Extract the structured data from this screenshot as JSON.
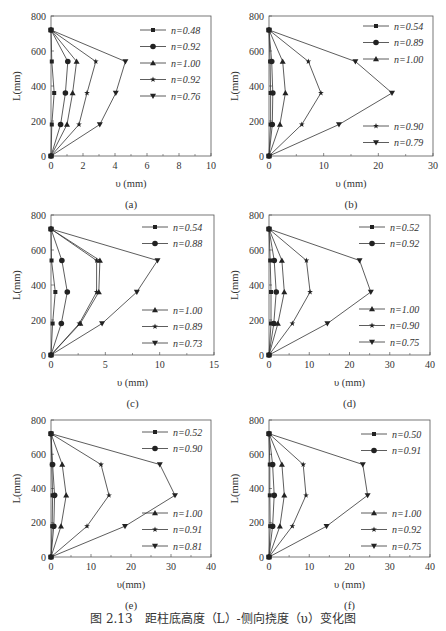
{
  "figure_caption": "图 2.13　距柱底高度（L）-侧向挠度（υ）变化图",
  "chart_data": [
    {
      "id": "a",
      "type": "line",
      "panel_label": "(a)",
      "xlabel": "υ (mm)",
      "ylabel": "L(mm)",
      "xlim": [
        0,
        10
      ],
      "ylim": [
        0,
        800
      ],
      "xticks": [
        0,
        2,
        4,
        6,
        8,
        10
      ],
      "yticks": [
        0,
        200,
        400,
        600,
        800
      ],
      "y": [
        0,
        180,
        360,
        540,
        720
      ],
      "legend_position": "upper-right",
      "series": [
        {
          "name": "n=0.48",
          "marker": "square",
          "values": [
            0,
            0.05,
            0.2,
            0.05,
            0
          ]
        },
        {
          "name": "n=0.92",
          "marker": "circle",
          "values": [
            0,
            0.6,
            0.9,
            1.05,
            0
          ]
        },
        {
          "name": "n=1.00",
          "marker": "triangle-up",
          "values": [
            0,
            1.0,
            1.35,
            1.6,
            0
          ]
        },
        {
          "name": "n=0.92",
          "marker": "star",
          "values": [
            0,
            1.75,
            2.25,
            2.8,
            0
          ]
        },
        {
          "name": "n=0.76",
          "marker": "triangle-down",
          "values": [
            0,
            3.05,
            4.05,
            4.65,
            0
          ]
        }
      ]
    },
    {
      "id": "b",
      "type": "line",
      "panel_label": "(b)",
      "xlabel": "υ (mm)",
      "ylabel": "L(mm)",
      "xlim": [
        0,
        30
      ],
      "ylim": [
        0,
        800
      ],
      "xticks": [
        0,
        10,
        20,
        30
      ],
      "yticks": [
        0,
        200,
        400,
        600,
        800
      ],
      "y": [
        0,
        180,
        360,
        540,
        720
      ],
      "legend_position": "split upper-right / lower-right",
      "series": [
        {
          "name": "n=0.54",
          "marker": "square",
          "values": [
            0,
            0.3,
            0.3,
            0.2,
            0
          ]
        },
        {
          "name": "n=0.89",
          "marker": "circle",
          "values": [
            0,
            0.6,
            0.7,
            0.5,
            0
          ]
        },
        {
          "name": "n=1.00",
          "marker": "triangle-up",
          "values": [
            0,
            2.0,
            3.0,
            2.5,
            0
          ]
        },
        {
          "name": "n=0.90",
          "marker": "star",
          "values": [
            0,
            6.0,
            9.5,
            7.2,
            0
          ]
        },
        {
          "name": "n=0.79",
          "marker": "triangle-down",
          "values": [
            0,
            12.8,
            22.5,
            15.8,
            0
          ]
        }
      ]
    },
    {
      "id": "c",
      "type": "line",
      "panel_label": "(c)",
      "xlabel": "υ (mm)",
      "ylabel": "L(mm)",
      "xlim": [
        0,
        15
      ],
      "ylim": [
        0,
        800
      ],
      "xticks": [
        0,
        5,
        10,
        15
      ],
      "yticks": [
        0,
        200,
        400,
        600,
        800
      ],
      "y": [
        0,
        180,
        360,
        540,
        720
      ],
      "legend_position": "split upper-right / lower-right",
      "series": [
        {
          "name": "n=0.54",
          "marker": "square",
          "values": [
            0,
            0.15,
            0.4,
            0.05,
            0
          ]
        },
        {
          "name": "n=0.88",
          "marker": "circle",
          "values": [
            0,
            0.95,
            1.5,
            1.0,
            0
          ]
        },
        {
          "name": "n=1.00",
          "marker": "triangle-up",
          "values": [
            0,
            2.7,
            4.4,
            4.5,
            0
          ]
        },
        {
          "name": "n=0.89",
          "marker": "star",
          "values": [
            0,
            2.6,
            4.2,
            4.2,
            0
          ]
        },
        {
          "name": "n=0.73",
          "marker": "triangle-down",
          "values": [
            0,
            4.7,
            7.9,
            9.8,
            0
          ]
        }
      ]
    },
    {
      "id": "d",
      "type": "line",
      "panel_label": "(d)",
      "xlabel": "υ (mm)",
      "ylabel": "L(mm)",
      "xlim": [
        0,
        40
      ],
      "ylim": [
        0,
        800
      ],
      "xticks": [
        0,
        10,
        20,
        30,
        40
      ],
      "yticks": [
        0,
        200,
        400,
        600,
        800
      ],
      "y": [
        0,
        180,
        360,
        540,
        720
      ],
      "legend_position": "split upper-right / lower-right",
      "series": [
        {
          "name": "n=0.52",
          "marker": "square",
          "values": [
            0,
            0.5,
            0.5,
            0.3,
            0
          ]
        },
        {
          "name": "n=0.92",
          "marker": "circle",
          "values": [
            0,
            1.2,
            1.8,
            1.3,
            0
          ]
        },
        {
          "name": "n=1.00",
          "marker": "triangle-up",
          "values": [
            0,
            2.2,
            3.8,
            3.2,
            0
          ]
        },
        {
          "name": "n=0.90",
          "marker": "star",
          "values": [
            0,
            5.8,
            10.2,
            9.3,
            0
          ]
        },
        {
          "name": "n=0.75",
          "marker": "triangle-down",
          "values": [
            0,
            14.5,
            25.3,
            22.5,
            0
          ]
        }
      ]
    },
    {
      "id": "e",
      "type": "line",
      "panel_label": "(e)",
      "xlabel": "υ(mm)",
      "ylabel": "L(mm)",
      "xlim": [
        0,
        40
      ],
      "ylim": [
        0,
        800
      ],
      "xticks": [
        0,
        10,
        20,
        30,
        40
      ],
      "yticks": [
        0,
        200,
        400,
        600,
        800
      ],
      "y": [
        0,
        180,
        360,
        540,
        720
      ],
      "legend_position": "split upper-right / lower-right",
      "series": [
        {
          "name": "n=0.52",
          "marker": "square",
          "values": [
            0,
            0.3,
            0.4,
            0.2,
            0
          ]
        },
        {
          "name": "n=0.90",
          "marker": "circle",
          "values": [
            0,
            0.7,
            0.9,
            0.4,
            0
          ]
        },
        {
          "name": "n=1.00",
          "marker": "triangle-up",
          "values": [
            0,
            2.5,
            3.8,
            2.8,
            0
          ]
        },
        {
          "name": "n=0.91",
          "marker": "star",
          "values": [
            0,
            9.0,
            14.5,
            12.5,
            0
          ]
        },
        {
          "name": "n=0.81",
          "marker": "triangle-down",
          "values": [
            0,
            18.5,
            31.0,
            27.2,
            0
          ]
        }
      ]
    },
    {
      "id": "f",
      "type": "line",
      "panel_label": "(f)",
      "xlabel": "υ (mm)",
      "ylabel": "L(mm)",
      "xlim": [
        0,
        40
      ],
      "ylim": [
        0,
        800
      ],
      "xticks": [
        0,
        10,
        20,
        30,
        40
      ],
      "yticks": [
        0,
        200,
        400,
        600,
        800
      ],
      "y": [
        0,
        180,
        360,
        540,
        720
      ],
      "legend_position": "split upper-right / lower-right",
      "series": [
        {
          "name": "n=0.50",
          "marker": "square",
          "values": [
            0,
            0.3,
            0.2,
            0.2,
            0
          ]
        },
        {
          "name": "n=0.91",
          "marker": "circle",
          "values": [
            0,
            0.9,
            1.3,
            0.9,
            0
          ]
        },
        {
          "name": "n=1.00",
          "marker": "triangle-up",
          "values": [
            0,
            2.7,
            3.8,
            3.2,
            0
          ]
        },
        {
          "name": "n=0.92",
          "marker": "star",
          "values": [
            0,
            5.8,
            9.2,
            8.5,
            0
          ]
        },
        {
          "name": "n=0.75",
          "marker": "triangle-down",
          "values": [
            0,
            14.3,
            24.5,
            23.3,
            0
          ]
        }
      ]
    }
  ],
  "layout": {
    "panels": [
      {
        "id": "a",
        "left": 0,
        "top": 0,
        "plot": {
          "x0": 51,
          "x1": 211,
          "y0": 156,
          "y1": 16
        },
        "legend_top_rows": 5,
        "legend_x": 140,
        "legend_y": 30
      },
      {
        "id": "b",
        "left": 223,
        "top": 0,
        "plot": {
          "x0": 46,
          "x1": 210,
          "y0": 156,
          "y1": 16
        },
        "legend_top_rows": 3,
        "legend_x": 140,
        "legend_y": 26,
        "legend_bottom_y": 126
      },
      {
        "id": "c",
        "left": 0,
        "top": 210,
        "plot": {
          "x0": 51,
          "x1": 214,
          "y0": 145,
          "y1": 5
        },
        "legend_top_rows": 2,
        "legend_x": 142,
        "legend_y": 17,
        "legend_bottom_y": 100
      },
      {
        "id": "d",
        "left": 223,
        "top": 210,
        "plot": {
          "x0": 46,
          "x1": 207,
          "y0": 145,
          "y1": 5
        },
        "legend_top_rows": 2,
        "legend_x": 136,
        "legend_y": 17,
        "legend_bottom_y": 99
      },
      {
        "id": "e",
        "left": 0,
        "top": 415,
        "plot": {
          "x0": 51,
          "x1": 211,
          "y0": 142,
          "y1": 5
        },
        "legend_top_rows": 2,
        "legend_x": 142,
        "legend_y": 17,
        "legend_bottom_y": 98
      },
      {
        "id": "f",
        "left": 223,
        "top": 415,
        "plot": {
          "x0": 46,
          "x1": 207,
          "y0": 142,
          "y1": 5
        },
        "legend_top_rows": 2,
        "legend_x": 138,
        "legend_y": 19,
        "legend_bottom_y": 98
      }
    ]
  }
}
